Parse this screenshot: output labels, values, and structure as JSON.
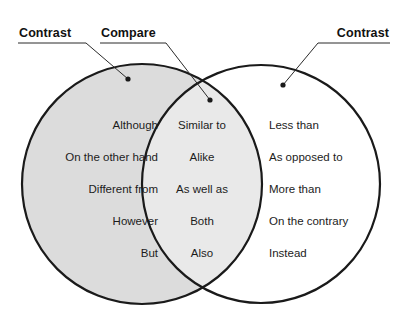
{
  "diagram": {
    "type": "venn-2-set",
    "colors": {
      "left_circle_fill": "#dcdcdc",
      "lens_fill": "#e8e8e8",
      "right_circle_fill": "#ffffff",
      "outline": "#1a1a1a",
      "text": "#1c1c1c",
      "background": "#ffffff"
    }
  },
  "labels": {
    "left": "Contrast",
    "center": "Compare",
    "right": "Contrast"
  },
  "sets": {
    "left": {
      "label": "Contrast",
      "words": [
        "Although",
        "On the other hand",
        "Different from",
        "However",
        "But"
      ]
    },
    "intersection": {
      "label": "Compare",
      "words": [
        "Similar to",
        "Alike",
        "As well as",
        "Both",
        "Also"
      ]
    },
    "right": {
      "label": "Contrast",
      "words": [
        "Less than",
        "As opposed to",
        "More than",
        "On the contrary",
        "Instead"
      ]
    }
  }
}
